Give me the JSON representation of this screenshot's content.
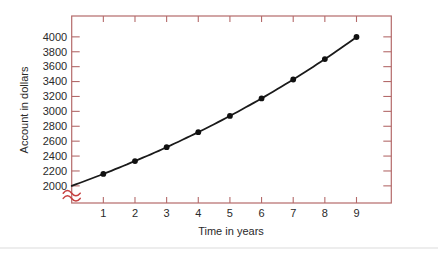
{
  "chart_data": {
    "type": "line",
    "title": "",
    "xlabel": "Time in years",
    "ylabel": "Account in dollars",
    "x": [
      1,
      2,
      3,
      4,
      5,
      6,
      7,
      8,
      9
    ],
    "values": [
      2160,
      2333,
      2519,
      2721,
      2939,
      3174,
      3428,
      3702,
      3998
    ],
    "curve_start": {
      "x": 0,
      "y": 2000
    },
    "x_ticks": [
      1,
      2,
      3,
      4,
      5,
      6,
      7,
      8,
      9
    ],
    "y_ticks": [
      2000,
      2200,
      2400,
      2600,
      2800,
      3000,
      3200,
      3400,
      3600,
      3800,
      4000
    ],
    "xlim": [
      0,
      10.1
    ],
    "ylim": [
      1770,
      4280
    ],
    "grid": false,
    "legend": "none",
    "frame": "box-with-inward-ticks-all-sides",
    "axis_break": {
      "present": true,
      "axis": "y",
      "location": "below 2000"
    },
    "marker": "filled-circle",
    "colors": {
      "frame": "#b46a6a",
      "curve": "#1a1a1a",
      "marker": "#111111",
      "break_mark": "#c63f3f",
      "text": "#2a2a2a",
      "background": "#ffffff",
      "bottom_divider": "#ededed"
    }
  }
}
